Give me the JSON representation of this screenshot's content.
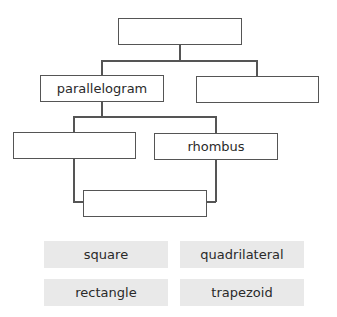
{
  "diagram": {
    "type": "hierarchy",
    "boxes": {
      "root": "",
      "level2_left": "parallelogram",
      "level2_right": "",
      "level3_left": "",
      "level3_right": "rhombus",
      "level4": ""
    }
  },
  "word_bank": {
    "tiles": [
      "square",
      "quadrilateral",
      "rectangle",
      "trapezoid"
    ]
  }
}
